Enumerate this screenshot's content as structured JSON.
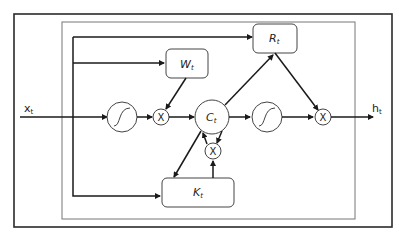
{
  "diagram": {
    "type": "gated recurrent cell block diagram",
    "input_label": "x",
    "input_sub": "t",
    "output_label": "h",
    "output_sub": "t",
    "boxes": {
      "W": {
        "label": "W",
        "sub": "t"
      },
      "R": {
        "label": "R",
        "sub": "t"
      },
      "K": {
        "label": "K",
        "sub": "t"
      }
    },
    "cell_state": {
      "label": "C",
      "sub": "t"
    },
    "activation_symbol": "sigmoid-curve",
    "multiply_symbol": "X",
    "colors": {
      "line": "#1a1a1a",
      "frame": "#2a2a2a",
      "inner_frame": "#777777",
      "background": "#ffffff"
    }
  }
}
